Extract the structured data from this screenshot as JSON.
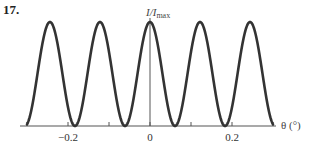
{
  "figure": {
    "number": "17."
  },
  "chart_data": {
    "type": "line",
    "title": "",
    "xlabel": "θ (°)",
    "ylabel": "I/Imax",
    "ylabel_parts": {
      "base": "I/I",
      "sub": "max"
    },
    "xlim": [
      -0.3,
      0.3
    ],
    "ylim": [
      0,
      1
    ],
    "x_ticks": [
      -0.3,
      -0.2,
      -0.1,
      0,
      0.1,
      0.2,
      0.3
    ],
    "x_tick_labels": [
      {
        "value": -0.2,
        "label": "−0.2"
      },
      {
        "value": 0,
        "label": "0"
      },
      {
        "value": 0.2,
        "label": "0.2"
      }
    ],
    "grid": false,
    "legend": null,
    "series": [
      {
        "name": "I/Imax",
        "function": "cos^2(pi * theta / 0.122)",
        "period_deg": 0.122,
        "maxima_x": [
          -0.247,
          -0.122,
          0,
          0.122,
          0.247
        ],
        "minima_x": [
          -0.184,
          -0.061,
          0.061,
          0.184
        ],
        "x_range": [
          -0.3,
          0.3
        ],
        "color": "#333333"
      }
    ]
  },
  "colors": {
    "curve": "#333333",
    "axis": "#555555",
    "text": "#333333"
  }
}
